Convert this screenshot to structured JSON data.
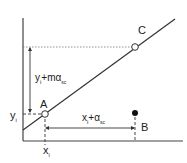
{
  "diagram": {
    "points": {
      "A": {
        "label": "A",
        "filled": false
      },
      "B": {
        "label": "B",
        "filled": true
      },
      "C": {
        "label": "C",
        "filled": false
      }
    },
    "axis_labels": {
      "y_tick": {
        "base": "y",
        "sub": "i"
      },
      "x_tick": {
        "base": "x",
        "sub": "i"
      }
    },
    "annotations": {
      "vertical": {
        "base": "y",
        "sub": "i",
        "mid": "+mα",
        "sub2": "sc"
      },
      "horizontal": {
        "base": "x",
        "sub": "i",
        "mid": "+α",
        "sub2": "sc"
      }
    },
    "colors": {
      "line": "#333333",
      "axis": "#444444",
      "dash": "#555555",
      "point_fill_open": "#ffffff",
      "point_fill_solid": "#111111"
    }
  }
}
